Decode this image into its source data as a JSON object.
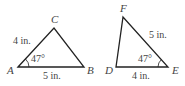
{
  "triangles": [
    {
      "name": "ABC",
      "vertices": {
        "A": "A",
        "B": "B",
        "C": "C"
      },
      "side_AC": "4 in.",
      "side_AB": "5 in.",
      "angle_A": "47°"
    },
    {
      "name": "DEF",
      "vertices": {
        "D": "D",
        "E": "E",
        "F": "F"
      },
      "side_EF": "5 in.",
      "side_DE": "4 in.",
      "angle_E": "47°"
    }
  ],
  "colors": {
    "stroke": "#222222",
    "text": "#444444"
  }
}
